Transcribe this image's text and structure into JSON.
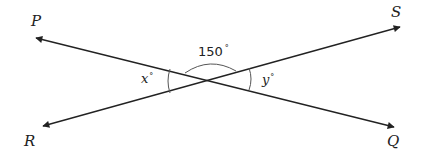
{
  "diagram": {
    "type": "intersecting-lines",
    "colors": {
      "line": "#222222",
      "arc": "#555555",
      "text": "#222222",
      "background": "#ffffff"
    },
    "lines": [
      {
        "name": "PQ",
        "from": "P",
        "to": "Q"
      },
      {
        "name": "RS",
        "from": "R",
        "to": "S"
      }
    ],
    "points": {
      "P": {
        "label": "P"
      },
      "Q": {
        "label": "Q"
      },
      "R": {
        "label": "R"
      },
      "S": {
        "label": "S"
      }
    },
    "angles": {
      "top": {
        "value": "150",
        "degree": "°"
      },
      "left": {
        "var": "x",
        "degree": "°"
      },
      "right": {
        "var": "y",
        "degree": "°"
      }
    }
  }
}
